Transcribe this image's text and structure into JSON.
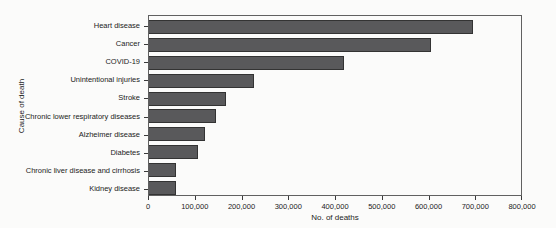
{
  "chart_data": {
    "type": "bar",
    "orientation": "horizontal",
    "title": "",
    "xlabel": "No. of deaths",
    "ylabel": "Cause of death",
    "xlim": [
      0,
      800000
    ],
    "x_ticks": [
      "0",
      "100,000",
      "200,000",
      "300,000",
      "400,000",
      "500,000",
      "600,000",
      "700,000",
      "800,000"
    ],
    "categories": [
      "Heart disease",
      "Cancer",
      "COVID-19",
      "Unintentional injuries",
      "Stroke",
      "Chronic lower respiratory diseases",
      "Alzheimer disease",
      "Diabetes",
      "Chronic liver disease and cirrhosis",
      "Kidney disease"
    ],
    "values": [
      695000,
      605000,
      417000,
      224000,
      163000,
      142000,
      119000,
      103000,
      57000,
      55000
    ],
    "grid": false,
    "legend": false,
    "colors": {
      "bar_fill": "#59595b",
      "bar_border": "#333333",
      "plot_border": "#606060",
      "axis": "#3a3a3a",
      "text": "#222222",
      "background": "#fbfbfa"
    }
  }
}
